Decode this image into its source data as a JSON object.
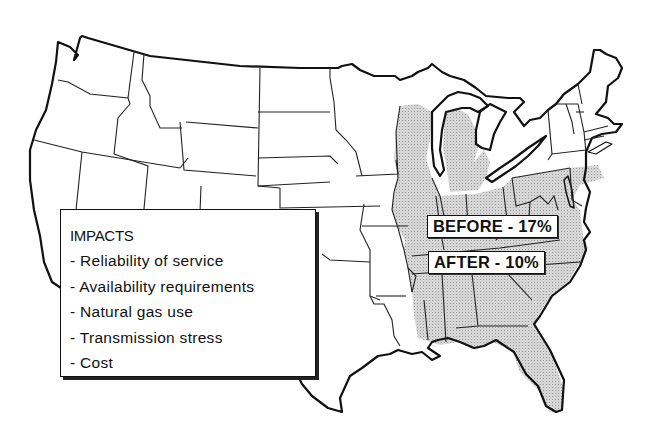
{
  "map": {
    "title": "United States electric power impact map",
    "shaded_region": "Eastern United States (Midwest, Mid-Atlantic, Southeast)",
    "shade_color": "#cfcfcf",
    "outline_color": "#111111"
  },
  "impacts": {
    "title": "IMPACTS",
    "items": [
      "- Reliability of service",
      "- Availability requirements",
      "- Natural gas use",
      "- Transmission stress",
      "- Cost"
    ]
  },
  "labels": {
    "before": "BEFORE - 17%",
    "after": "AFTER - 10%"
  }
}
